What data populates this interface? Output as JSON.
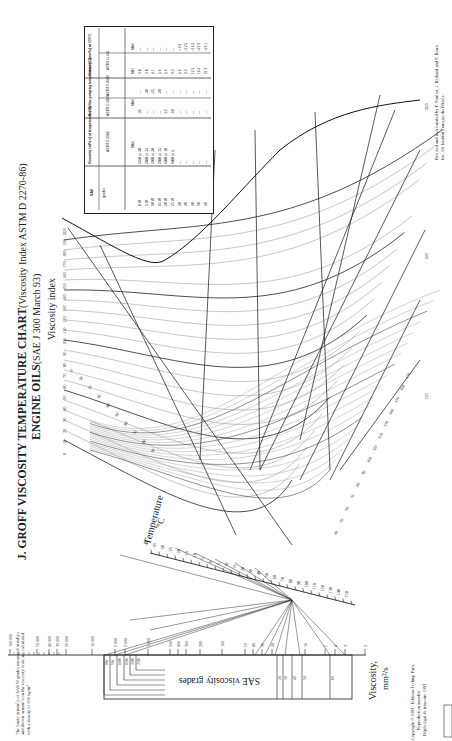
{
  "title": {
    "main": "J. GROFF VISCOSITY TEMPERATURE CHART",
    "sub": "(Viscosity Index ASTM D 2270-86)",
    "line2_main": "ENGINE OILS",
    "line2_sub": "(SAE J 300 March 93)"
  },
  "credits": {
    "right_line1": "Revised and recalculated by P. Pouliot, J. Richard and F. Roux.",
    "right_line2": "Inc. 94. Institut Français du Pétrole.",
    "left_line1": "Copyright © 1993 - Editions Technip Paris",
    "left_line2": "Reproduction interdite",
    "left_line3": "Dépôt légal 4e trimestre 1993",
    "note": "The limits in mm²/s of SAE W grades measured in mPa.s and shown in mm²/s on the viscosity scale are calculated with a density of 900 kg/m³"
  },
  "chart_data": {
    "type": "nomograph",
    "orientation": "rotated 90° counter-clockwise",
    "viscosity_index_label": "Viscosity index",
    "viscosity_index_ticks": [
      0,
      10,
      20,
      30,
      40,
      50,
      60,
      70,
      80,
      90,
      100,
      110,
      120,
      130,
      140,
      150,
      160,
      170,
      180,
      190,
      200
    ],
    "viscosity_index_curve_labels_right": [
      120,
      160,
      200
    ],
    "temperature_label": "Temperature",
    "temperature_unit": "°C",
    "temperature_ticks": [
      -40,
      -35,
      -30,
      -25,
      -20,
      -15,
      -10,
      -5,
      0,
      5,
      10,
      15,
      20,
      30,
      40,
      50,
      60,
      70,
      80,
      90,
      100,
      110,
      120,
      130,
      140,
      150
    ],
    "viscosity_label": "Viscosity,",
    "viscosity_unit": "mm²/s",
    "viscosity_ticks": [
      100000,
      50000,
      40000,
      30000,
      20000,
      10000,
      5000,
      2000,
      1000,
      500,
      400,
      300,
      200,
      100,
      50,
      40,
      30,
      20,
      10,
      5,
      4,
      3,
      2
    ],
    "sae_grades_label": "SAE viscosity grades",
    "sae_grade_marks": [
      "0W",
      "5W",
      "10W",
      "15W",
      "20W",
      "25W",
      "20",
      "30",
      "40",
      "50",
      "60"
    ]
  },
  "table": {
    "headers": {
      "sae": "SAE",
      "grades": "grades",
      "cranking": "Viscosity (mPa.s) at temperature (°C)",
      "cranking_std": "ASTM D 2602",
      "pumping": "Borderline pumping temperature (°C)",
      "pumping_std1": "ASTM D 3829",
      "pumping_std2": "ASTM D 4684",
      "kinematic": "Viscosity (mm²/s) at 100°C",
      "kinematic_std": "ASTM D 445",
      "max": "MAX",
      "min": "MIN"
    },
    "rows": [
      {
        "grade": "0 W",
        "cranking": "3250 at -30",
        "p1": "-35",
        "p2": "—",
        "min": "3.8",
        "max": "—"
      },
      {
        "grade": "5 W",
        "cranking": "3500 at -25",
        "p1": "—",
        "p2": "-30",
        "min": "3.8",
        "max": "—"
      },
      {
        "grade": "10 W",
        "cranking": "3500 at -20",
        "p1": "—",
        "p2": "-25",
        "min": "4.1",
        "max": "—"
      },
      {
        "grade": "15 W",
        "cranking": "3500 at -15",
        "p1": "—",
        "p2": "-20",
        "min": "5.6",
        "max": "—"
      },
      {
        "grade": "20 W",
        "cranking": "4500 at -10",
        "p1": "-15",
        "p2": "—",
        "min": "5.6",
        "max": "—"
      },
      {
        "grade": "25 W",
        "cranking": "6000 at -5",
        "p1": "-10",
        "p2": "—",
        "min": "9.3",
        "max": "—"
      },
      {
        "grade": "20",
        "cranking": "—",
        "p1": "—",
        "p2": "—",
        "min": "5.6",
        "max": "< 9.3"
      },
      {
        "grade": "30",
        "cranking": "—",
        "p1": "—",
        "p2": "—",
        "min": "9.3",
        "max": "<12.5"
      },
      {
        "grade": "40",
        "cranking": "—",
        "p1": "—",
        "p2": "—",
        "min": "12.5",
        "max": "<16.3"
      },
      {
        "grade": "50",
        "cranking": "—",
        "p1": "—",
        "p2": "—",
        "min": "16.3",
        "max": "<21.9"
      },
      {
        "grade": "60",
        "cranking": "—",
        "p1": "—",
        "p2": "—",
        "min": "21.9",
        "max": "<26.1"
      }
    ]
  }
}
